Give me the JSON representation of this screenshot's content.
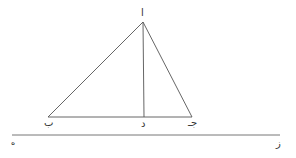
{
  "diagram": {
    "type": "geometry-figure",
    "stroke_color": "#555555",
    "points": {
      "alif": {
        "label": "ا",
        "x": 143,
        "y": 22
      },
      "ba": {
        "label": "ب",
        "x": 48,
        "y": 117
      },
      "dal": {
        "label": "د",
        "x": 144,
        "y": 117
      },
      "jim": {
        "label": "جـ",
        "x": 192,
        "y": 117
      },
      "ha": {
        "label": "ه",
        "x": 12,
        "y": 135
      },
      "zay": {
        "label": "ز",
        "x": 280,
        "y": 135
      }
    },
    "segments": [
      [
        "alif",
        "ba"
      ],
      [
        "alif",
        "jim"
      ],
      [
        "ba",
        "jim"
      ],
      [
        "alif",
        "dal"
      ],
      [
        "ha",
        "zay"
      ]
    ]
  }
}
